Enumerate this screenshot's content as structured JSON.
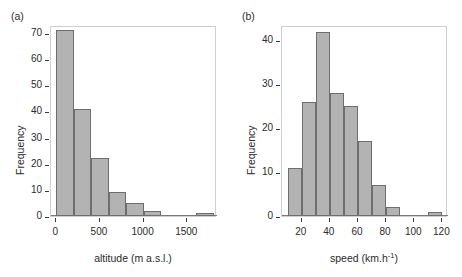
{
  "figure": {
    "background": "#ffffff",
    "bar_fill": "#b3b3b3",
    "bar_stroke": "#6e6e6e",
    "axis_color": "#3a3a3a",
    "frame_color": "#cfcfcf"
  },
  "panels": [
    {
      "tag": "(a)"
    },
    {
      "tag": "(b)"
    }
  ],
  "chart_data": [
    {
      "type": "bar",
      "title": "",
      "subtitle": "",
      "panel": "(a)",
      "xlabel": "altitude (m a.s.l.)",
      "ylabel": "Frequency",
      "grid": false,
      "legend": "none",
      "xlim": [
        -60,
        1840
      ],
      "ylim": [
        0,
        73
      ],
      "xticks": [
        0,
        500,
        1000,
        1500
      ],
      "xticklabels": [
        "0",
        "500",
        "1000",
        "1500"
      ],
      "yticks": [
        0,
        10,
        20,
        30,
        40,
        50,
        60,
        70
      ],
      "yticklabels": [
        "0",
        "10",
        "20",
        "30",
        "40",
        "50",
        "60",
        "70"
      ],
      "bin_width": 200,
      "bin_edges": [
        0,
        200,
        400,
        600,
        800,
        1000,
        1200,
        1600,
        1800
      ],
      "bins": [
        {
          "x0": 0,
          "x1": 200,
          "value": 71
        },
        {
          "x0": 200,
          "x1": 400,
          "value": 41
        },
        {
          "x0": 400,
          "x1": 600,
          "value": 22
        },
        {
          "x0": 600,
          "x1": 800,
          "value": 9
        },
        {
          "x0": 800,
          "x1": 1000,
          "value": 5
        },
        {
          "x0": 1000,
          "x1": 1200,
          "value": 2
        },
        {
          "x0": 1600,
          "x1": 1800,
          "value": 1
        }
      ],
      "categories": [
        "0-200",
        "200-400",
        "400-600",
        "600-800",
        "800-1000",
        "1000-1200",
        "1600-1800"
      ],
      "values": [
        71,
        41,
        22,
        9,
        5,
        2,
        1
      ]
    },
    {
      "type": "bar",
      "title": "",
      "subtitle": "",
      "panel": "(b)",
      "xlabel": "speed (km.h-1)",
      "xlabel_base": "speed (km.h",
      "xlabel_sup": "-1",
      "xlabel_tail": ")",
      "ylabel": "Frequency",
      "grid": false,
      "legend": "none",
      "xlim": [
        6,
        124
      ],
      "ylim": [
        0,
        43.5
      ],
      "xticks": [
        20,
        40,
        60,
        80,
        100,
        120
      ],
      "xticklabels": [
        "20",
        "40",
        "60",
        "80",
        "100",
        "120"
      ],
      "yticks": [
        0,
        10,
        20,
        30,
        40
      ],
      "yticklabels": [
        "0",
        "10",
        "20",
        "30",
        "40"
      ],
      "bin_width": 10,
      "bin_edges": [
        10,
        20,
        30,
        40,
        50,
        60,
        70,
        80,
        90,
        110,
        120
      ],
      "bins": [
        {
          "x0": 10,
          "x1": 20,
          "value": 11
        },
        {
          "x0": 20,
          "x1": 30,
          "value": 26
        },
        {
          "x0": 30,
          "x1": 40,
          "value": 42
        },
        {
          "x0": 40,
          "x1": 50,
          "value": 28
        },
        {
          "x0": 50,
          "x1": 60,
          "value": 25
        },
        {
          "x0": 60,
          "x1": 70,
          "value": 17
        },
        {
          "x0": 70,
          "x1": 80,
          "value": 7
        },
        {
          "x0": 80,
          "x1": 90,
          "value": 2
        },
        {
          "x0": 110,
          "x1": 120,
          "value": 1
        }
      ],
      "categories": [
        "10-20",
        "20-30",
        "30-40",
        "40-50",
        "50-60",
        "60-70",
        "70-80",
        "80-90",
        "110-120"
      ],
      "values": [
        11,
        26,
        42,
        28,
        25,
        17,
        7,
        2,
        1
      ]
    }
  ]
}
